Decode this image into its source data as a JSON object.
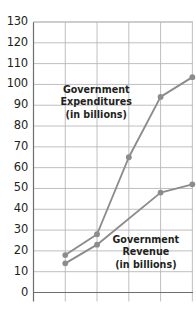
{
  "chart_data": {
    "type": "line",
    "title": "",
    "xlabel": "",
    "ylabel": "",
    "ylim": [
      0,
      130
    ],
    "ytick_step": 10,
    "yticks": [
      130,
      120,
      110,
      100,
      90,
      80,
      70,
      60,
      50,
      40,
      30,
      20,
      10,
      0
    ],
    "ytick_labels": [
      "130",
      "120",
      "110",
      "100",
      "90",
      "80",
      "70",
      "60",
      "50",
      "40",
      "30",
      "20",
      "10",
      "0"
    ],
    "xticks": [
      1,
      2,
      3,
      4,
      5
    ],
    "xtick_labels": [
      "",
      "",
      "",
      "",
      ""
    ],
    "grid": true,
    "legend_position": "inline-annotation",
    "series": [
      {
        "name": "Government Expenditures (in billions)",
        "x": [
          1,
          2,
          3,
          4,
          5
        ],
        "values": [
          18,
          28,
          65,
          94,
          103.5
        ],
        "color": "#8c8c8c",
        "marker": "circle"
      },
      {
        "name": "Government Revenue (in billions)",
        "x": [
          1,
          2,
          4,
          5
        ],
        "values": [
          14,
          23,
          48,
          52
        ],
        "color": "#8c8c8c",
        "marker": "circle"
      }
    ],
    "annotations": [
      {
        "name": "expenditures-label",
        "lines": [
          "Government",
          "Expenditures",
          "(in billions)"
        ],
        "x_px": 96,
        "y_px": 84
      },
      {
        "name": "revenue-label",
        "lines": [
          "Government",
          "Revenue",
          "(in billions)"
        ],
        "x_px": 146,
        "y_px": 234
      }
    ]
  },
  "style": {
    "line_color": "#8c8c8c",
    "marker_color": "#8c8c8c",
    "grid_color": "#b8b8b8",
    "axis_color": "#6e6e6e",
    "text_color": "#231f20",
    "background": "#ffffff"
  }
}
